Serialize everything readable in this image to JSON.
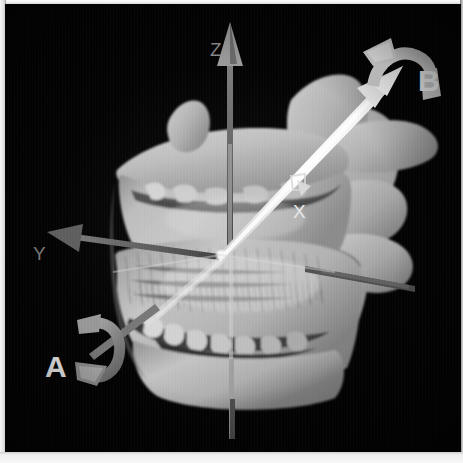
{
  "figure": {
    "kind": "3d-ct-volume-rendering",
    "background_color": "#030303",
    "bone_color": "#b4b4b4",
    "frame_color": "#f2f2f2"
  },
  "axes": [
    {
      "id": "z",
      "label": "Z",
      "label_color": "#8a8a8a",
      "shaft_color": "#6e6e6e",
      "direction": "up",
      "has_arrowhead": true,
      "arrowhead_color": "#9a9a9a"
    },
    {
      "id": "y",
      "label": "Y",
      "label_color": "#7d7d7d",
      "shaft_color": "#5e5e5e",
      "direction": "upper-left",
      "has_arrowhead": true,
      "arrowhead_color": "#6f6f6f"
    },
    {
      "id": "x",
      "label": "X",
      "label_color": "#e8e8e8",
      "shaft_color": "#d8d8d8",
      "direction": "into-plane-right",
      "has_arrowhead": true,
      "arrowhead_color": "#cfcfcf"
    }
  ],
  "rotation_markers": [
    {
      "id": "a",
      "label": "A",
      "label_color": "#f4f4f4",
      "arrow_color": "#8e8e8e",
      "description": "curved rotation arrow about the lower-left axis",
      "position": "lower-left"
    },
    {
      "id": "b",
      "label": "B",
      "label_color": "#fbfbfb",
      "arrow_color": "#e6e6e6",
      "description": "curved rotation arrow about the upper-right white axis",
      "position": "upper-right"
    }
  ],
  "annotations": {
    "origin_label": "",
    "caption": ""
  }
}
